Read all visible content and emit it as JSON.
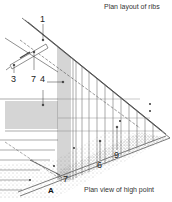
{
  "captions": {
    "top": "Plan layout of ribs",
    "bottom": "Plan view of high point"
  },
  "labels": {
    "l1": "1",
    "l3": "3",
    "l7a": "7",
    "l4": "4",
    "l6": "6",
    "l9": "9",
    "l7b": "7",
    "A": "A"
  },
  "colors": {
    "line": "#444444",
    "stipple": "#777777",
    "text": "#222222",
    "background": "#ffffff"
  }
}
